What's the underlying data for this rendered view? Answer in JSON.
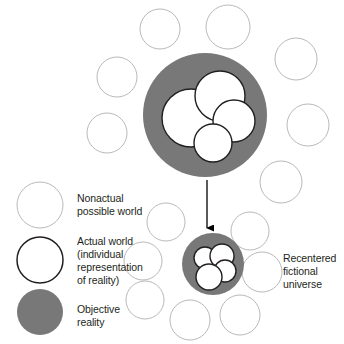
{
  "figure": {
    "background_color": "#ffffff",
    "colors": {
      "objective_reality_fill": "#787878",
      "nonactual_stroke": "#b9b9ba",
      "actual_world_stroke": "#231f20",
      "text": "#231f20",
      "arrow": "#000000"
    }
  },
  "legend": {
    "items": [
      {
        "key": "nonactual",
        "label": "Nonactual\npossible world",
        "swatch": "thin-outline-circle",
        "swatch_cx": 40,
        "swatch_cy": 205,
        "swatch_r": 23,
        "label_x": 77,
        "label_y": 192
      },
      {
        "key": "actual",
        "label": "Actual world\n(individual\nrepresentation\nof reality)",
        "swatch": "thick-outline-circle",
        "swatch_cx": 40,
        "swatch_cy": 260,
        "swatch_r": 23,
        "label_x": 77,
        "label_y": 235
      },
      {
        "key": "objective",
        "label": "Objective\nreality",
        "swatch": "filled-gray-circle",
        "swatch_cx": 40,
        "swatch_cy": 312,
        "swatch_r": 23,
        "label_x": 77,
        "label_y": 303
      }
    ]
  },
  "callouts": [
    {
      "key": "recentered",
      "label": "Recentered\nfictional\nuniverse",
      "x": 283,
      "y": 252
    }
  ],
  "diagram": {
    "actual_universe": {
      "name": "objective-reality-large",
      "cx": 205,
      "cy": 115,
      "r": 62,
      "inner_worlds": [
        {
          "cx": 191,
          "cy": 118,
          "r": 29
        },
        {
          "cx": 220,
          "cy": 96,
          "r": 25
        },
        {
          "cx": 234,
          "cy": 121,
          "r": 21
        },
        {
          "cx": 213,
          "cy": 143,
          "r": 19
        }
      ]
    },
    "fictional_universe": {
      "name": "objective-reality-small",
      "cx": 213,
      "cy": 264,
      "r": 31,
      "inner_worlds": [
        {
          "cx": 205,
          "cy": 258,
          "r": 11
        },
        {
          "cx": 222,
          "cy": 256,
          "r": 12
        },
        {
          "cx": 225,
          "cy": 271,
          "r": 11
        },
        {
          "cx": 209,
          "cy": 277,
          "r": 13
        }
      ]
    },
    "arrow": {
      "x": 207,
      "y_start": 180,
      "y_end": 228
    },
    "nonactual_worlds": [
      {
        "cx": 160,
        "cy": 29,
        "r": 20
      },
      {
        "cx": 228,
        "cy": 27,
        "r": 22
      },
      {
        "cx": 296,
        "cy": 59,
        "r": 21
      },
      {
        "cx": 117,
        "cy": 77,
        "r": 20
      },
      {
        "cx": 308,
        "cy": 125,
        "r": 21
      },
      {
        "cx": 107,
        "cy": 133,
        "r": 20
      },
      {
        "cx": 281,
        "cy": 182,
        "r": 21
      },
      {
        "cx": 166,
        "cy": 222,
        "r": 19
      },
      {
        "cx": 250,
        "cy": 231,
        "r": 19
      },
      {
        "cx": 143,
        "cy": 261,
        "r": 19
      },
      {
        "cx": 262,
        "cy": 272,
        "r": 20
      },
      {
        "cx": 145,
        "cy": 300,
        "r": 19
      },
      {
        "cx": 190,
        "cy": 320,
        "r": 20
      },
      {
        "cx": 240,
        "cy": 315,
        "r": 20
      }
    ]
  }
}
